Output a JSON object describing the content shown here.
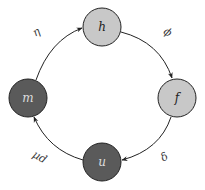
{
  "diagram": {
    "type": "cycle-graph",
    "nodes": [
      {
        "id": "h",
        "label": "h",
        "cx": 102,
        "cy": 27,
        "r": 19,
        "fill": "#c8c8c8",
        "text_color": "#222222"
      },
      {
        "id": "f",
        "label": "f",
        "cx": 177,
        "cy": 98,
        "r": 19,
        "fill": "#c8c8c8",
        "text_color": "#222222"
      },
      {
        "id": "u",
        "label": "u",
        "cx": 102,
        "cy": 162,
        "r": 19,
        "fill": "#5a5a5a",
        "text_color": "#dddddd"
      },
      {
        "id": "m",
        "label": "m",
        "cx": 28,
        "cy": 98,
        "r": 19,
        "fill": "#5a5a5a",
        "text_color": "#dddddd"
      }
    ],
    "edges": [
      {
        "from": "m",
        "to": "h",
        "label": "η",
        "label_x": 38,
        "label_y": 35
      },
      {
        "from": "h",
        "to": "f",
        "label": "ϕ",
        "label_x": 166,
        "label_y": 35
      },
      {
        "from": "f",
        "to": "u",
        "label": "δ",
        "label_x": 166,
        "label_y": 160
      },
      {
        "from": "u",
        "to": "m",
        "label": "μd",
        "label_x": 38,
        "label_y": 160
      }
    ],
    "colors": {
      "background": "#ffffff",
      "stroke": "#222222",
      "light_node": "#c8c8c8",
      "dark_node": "#5a5a5a"
    }
  }
}
